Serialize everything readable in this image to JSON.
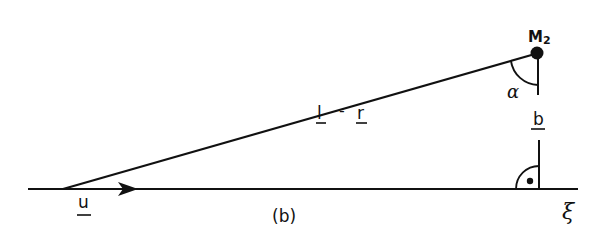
{
  "diagram": {
    "panel_label": "(b)",
    "point_label": "M",
    "point_subscript": "2",
    "vector_u": "u",
    "vector_diff_left": "l",
    "vector_diff_op": "-",
    "vector_diff_right": "r",
    "vector_b": "b",
    "angle_label": "α",
    "axis_label": "ξ",
    "colors": {
      "stroke": "#111111",
      "background": "#ffffff"
    }
  }
}
